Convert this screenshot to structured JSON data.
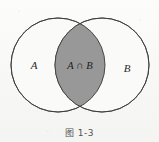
{
  "figure": {
    "caption": "图 1-3",
    "type": "venn-diagram",
    "background_color": "#f8f8f6",
    "stroke_color": "#3c3c3c",
    "shaded_fill_color": "#989898",
    "unshaded_fill_color": "#fafaf8",
    "sets": [
      {
        "id": "A",
        "label": "A",
        "label_x": 34,
        "label_y": 67,
        "center_x": 58,
        "center_y": 65,
        "radius": 47,
        "shaded": false
      },
      {
        "id": "B",
        "label": "B",
        "label_x": 127,
        "label_y": 70,
        "center_x": 102,
        "center_y": 65,
        "radius": 47,
        "shaded": false
      }
    ],
    "intersection": {
      "label": "A ∩ B",
      "label_x": 80,
      "label_y": 67,
      "shaded": true,
      "fill_color": "#989898"
    }
  }
}
